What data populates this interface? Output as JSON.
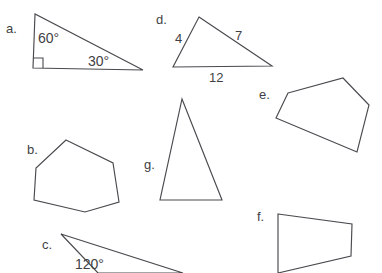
{
  "page": {
    "background_color": "#ffffff",
    "stroke_color": "#4a4a4f",
    "text_color": "#3f3f44",
    "width": 382,
    "height": 273
  },
  "shapes": {
    "a": {
      "key": "a.",
      "type": "right triangle",
      "points": "35,14 33,68 143,70",
      "angles": [
        {
          "value": "60°",
          "x": 38,
          "y": 31
        },
        {
          "value": "30°",
          "x": 88,
          "y": 54
        }
      ],
      "right_angle_mark": "33,58 43,58 43,68",
      "key_x": 6,
      "key_y": 22
    },
    "b": {
      "key": "b.",
      "type": "hexagon",
      "points": "66,140 113,163 119,202 85,212 34,200 36,168",
      "key_x": 27,
      "key_y": 143
    },
    "c": {
      "key": "c.",
      "type": "obtuse triangle",
      "points": "61,234 183,273 98,273",
      "angles": [
        {
          "value": "120°",
          "x": 75,
          "y": 257
        }
      ],
      "key_x": 42,
      "key_y": 238
    },
    "d": {
      "key": "d.",
      "type": "scalene triangle",
      "points": "199,17 272,66 173,67",
      "sides": [
        {
          "value": "4",
          "x": 175,
          "y": 32
        },
        {
          "value": "7",
          "x": 235,
          "y": 29
        },
        {
          "value": "12",
          "x": 209,
          "y": 71
        }
      ],
      "key_x": 156,
      "key_y": 13
    },
    "e": {
      "key": "e.",
      "type": "pentagon",
      "points": "288,93 343,78 369,105 357,152 276,118",
      "key_x": 259,
      "key_y": 88
    },
    "f": {
      "key": "f.",
      "type": "quadrilateral",
      "points": "278,214 352,224 351,256 278,273",
      "key_x": 257,
      "key_y": 210
    },
    "g": {
      "key": "g.",
      "type": "isosceles triangle",
      "points": "182,99 222,200 160,200",
      "key_x": 144,
      "key_y": 158
    }
  }
}
